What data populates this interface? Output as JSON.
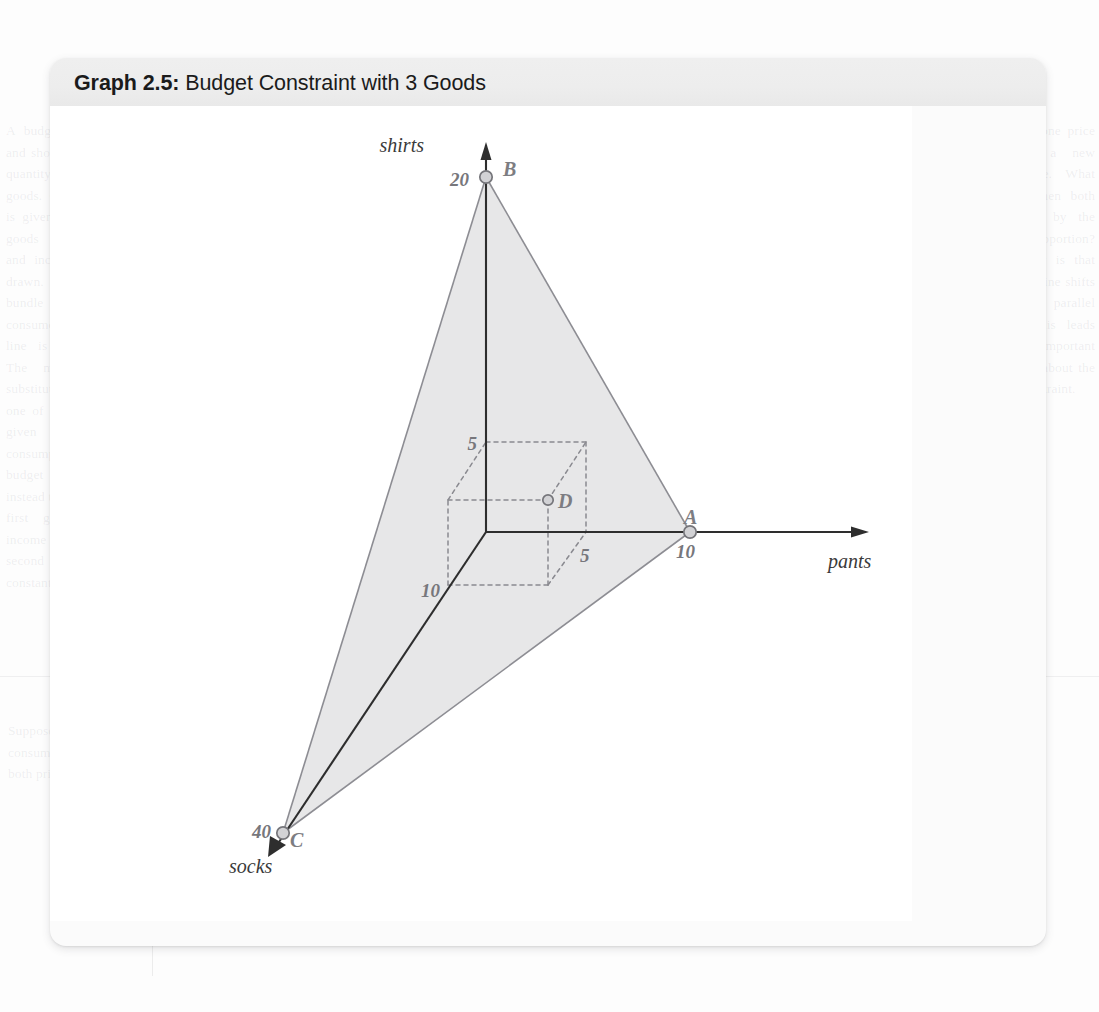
{
  "figure": {
    "title_lead": "Graph 2.5:",
    "title_rest": " Budget Constraint with 3 Goods"
  },
  "chart_data": {
    "type": "scatter",
    "title": "Graph 2.5: Budget Constraint with 3 Goods",
    "subtype": "3d-budget-plane",
    "grid": false,
    "legend": null,
    "axes": [
      {
        "name": "pants",
        "label": "pants",
        "intercept_label": "10",
        "intercept_value": 10,
        "direction": "right"
      },
      {
        "name": "shirts",
        "label": "shirts",
        "intercept_label": "20",
        "intercept_value": 20,
        "direction": "up"
      },
      {
        "name": "socks",
        "label": "socks",
        "intercept_label": "40",
        "intercept_value": 40,
        "direction": "down-left"
      }
    ],
    "points": [
      {
        "label": "A",
        "tick": "10",
        "axis": "pants",
        "coords": {
          "pants": 10,
          "shirts": 0,
          "socks": 0
        },
        "px": [
          690,
          532
        ]
      },
      {
        "label": "B",
        "tick": "20",
        "axis": "shirts",
        "coords": {
          "pants": 0,
          "shirts": 20,
          "socks": 0
        },
        "px": [
          486,
          177
        ]
      },
      {
        "label": "C",
        "tick": "40",
        "axis": "socks",
        "coords": {
          "pants": 0,
          "shirts": 0,
          "socks": 40
        },
        "px": [
          283,
          833
        ]
      },
      {
        "label": "D",
        "tick": null,
        "axis": "interior",
        "coords": {
          "pants": 5,
          "shirts": 5,
          "socks": 10
        },
        "px": [
          548,
          500
        ]
      }
    ],
    "origin_px": [
      486,
      532
    ],
    "budget_plane": {
      "vertices": [
        "A",
        "B",
        "C"
      ],
      "fill": "#e7e7e8",
      "stroke": "#8d8d93",
      "description": "Shaded budget-constraint plane joining intercepts A (10 pants), B (20 shirts) and C (40 socks)."
    },
    "guide_box": {
      "style": "dashed",
      "point": "D",
      "tick_labels": [
        {
          "text": "5",
          "axis": "shirts",
          "value": 5,
          "px": [
            468,
            445
          ]
        },
        {
          "text": "5",
          "axis": "pants",
          "value": 5,
          "px": [
            588,
            553
          ]
        },
        {
          "text": "10",
          "axis": "socks",
          "value": 10,
          "px": [
            424,
            590
          ]
        }
      ],
      "description": "Dashed rectangular box showing bundle D = (5 pants, 5 shirts, 10 socks)."
    },
    "colors": {
      "plane_fill": "#e7e7e8",
      "plane_edge": "#8d8d93",
      "axis": "#2e2e2e",
      "dashed_guide": "#8a8a90",
      "point_marker_fill": "#d2d2d5",
      "point_marker_stroke": "#75757a",
      "label_gray": "#7d7d82",
      "title_text": "#1b1b1b",
      "header_band": "#ededed",
      "card": "#fbfbfb"
    }
  },
  "background_page": {
    "ghost_top": "But the slope of the budget constraint in this case is 2 with a slope of each of the goods. Similarly, we find that B to A is",
    "ghost_left": "A budget price increases and shop and all the same quantity of most or less goods. Quantity of goods is given up for the other goods given that prices and income are fixed as drawn. Consider the bundle which costs the consumer and the budget line is shifted outward. The marginal rate of substitution is the other one of the good which is given for the first consumption bundle on the budget line. Suppose instead that the price of the first good rises while income and the price of the second good remain constant.",
    "ghost_right": "A shift in one price gives us a new budget line. What happens when both prices rise by the same proportion? The answer is that the budget line shifts inward in a parallel fashion. This leads us to an important conclusion about the budget constraint.",
    "ghost_bottom": "Suppose instead that the consumer's income rises and both prices stay the same.",
    "ghost_br": "2.4"
  }
}
